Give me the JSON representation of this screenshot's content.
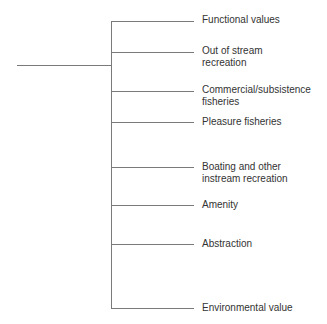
{
  "diagram": {
    "type": "tree-bracket",
    "colors": {
      "line": "#7a7a7a",
      "text": "#333333",
      "background": "#ffffff"
    },
    "branches": [
      {
        "line1": "Functional values",
        "line2": ""
      },
      {
        "line1": "Out of stream",
        "line2": "recreation"
      },
      {
        "line1": "Commercial/subsistence",
        "line2": "fisheries"
      },
      {
        "line1": "Pleasure fisheries",
        "line2": ""
      },
      {
        "line1": "Boating and other",
        "line2": "instream recreation"
      },
      {
        "line1": "Amenity",
        "line2": ""
      },
      {
        "line1": "Abstraction",
        "line2": ""
      },
      {
        "line1": "Environmental value",
        "line2": ""
      }
    ]
  }
}
